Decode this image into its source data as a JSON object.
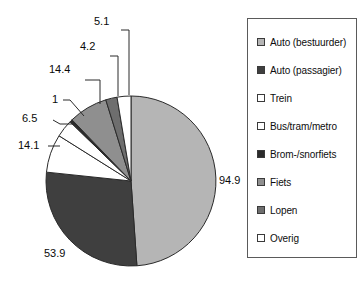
{
  "chart_data": {
    "type": "pie",
    "title": "",
    "subtitle": "",
    "xlabel": "",
    "ylabel": "",
    "legend_position": "right",
    "grid": false,
    "total": 194.1,
    "categories": [
      "Auto (bestuurder)",
      "Auto (passagier)",
      "Trein",
      "Bus/tram/metro",
      "Brom-/snorfiets",
      "Fiets",
      "Lopen",
      "Overig"
    ],
    "values": [
      94.9,
      53.9,
      14.1,
      6.5,
      1,
      14.4,
      4.2,
      5.1
    ],
    "colors": [
      "#b5b5b5",
      "#3f3f3f",
      "#ffffff",
      "#ffffff",
      "#2b2b2b",
      "#8f8f8f",
      "#6e6e6e",
      "#ffffff"
    ],
    "data_labels": [
      "94.9",
      "53.9",
      "14.1",
      "6.5",
      "1",
      "14.4",
      "4.2",
      "5.1"
    ]
  },
  "legend": {
    "items": [
      {
        "label": "Auto (bestuurder)",
        "color": "#b5b5b5"
      },
      {
        "label": "Auto (passagier)",
        "color": "#3f3f3f"
      },
      {
        "label": "Trein",
        "color": "#ffffff"
      },
      {
        "label": "Bus/tram/metro",
        "color": "#ffffff"
      },
      {
        "label": "Brom-/snorfiets",
        "color": "#2b2b2b"
      },
      {
        "label": "Fiets",
        "color": "#8f8f8f"
      },
      {
        "label": "Lopen",
        "color": "#6e6e6e"
      },
      {
        "label": "Overig",
        "color": "#ffffff"
      }
    ]
  },
  "labels": {
    "v0": "94.9",
    "v1": "53.9",
    "v2": "14.1",
    "v3": "6.5",
    "v4": "1",
    "v5": "14.4",
    "v6": "4.2",
    "v7": "5.1"
  }
}
